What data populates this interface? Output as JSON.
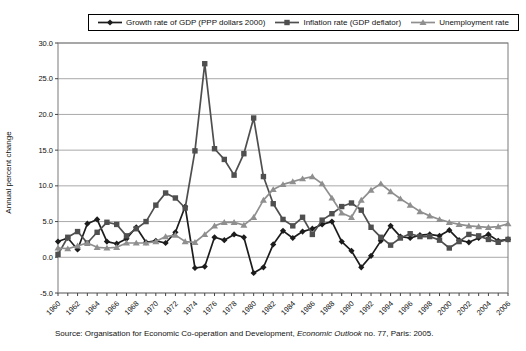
{
  "legend": {
    "items": [
      {
        "label": "Growth rate of GDP (PPP dollars 2000)",
        "marker": "diamond",
        "color": "#1c1c1c"
      },
      {
        "label": "Inflation rate (GDP deflator)",
        "marker": "square",
        "color": "#4f4f4f"
      },
      {
        "label": "Unemployment rate",
        "marker": "triangle",
        "color": "#8f8f8f"
      }
    ]
  },
  "axes": {
    "y_title": "Annual percent change",
    "y_ticks": [
      "30.0",
      "25.0",
      "20.0",
      "15.0",
      "10.0",
      "5.0",
      "0.0",
      "-5.0"
    ],
    "x_ticks": [
      "1960",
      "1962",
      "1964",
      "1966",
      "1968",
      "1970",
      "1972",
      "1974",
      "1976",
      "1978",
      "1980",
      "1982",
      "1984",
      "1986",
      "1988",
      "1990",
      "1992",
      "1994",
      "1996",
      "1998",
      "2000",
      "2002",
      "2004",
      "2006"
    ]
  },
  "source": {
    "prefix": "Source: Organisation for Economic Co-operation and Development, ",
    "italic": "Economic Outlook",
    "suffix": " no. 77, Paris: 2005."
  },
  "colors": {
    "gridline": "#a9a9a9",
    "plot_border": "#7a7a7a",
    "axis_text": "#111111",
    "legend_border": "#000000"
  },
  "chart_data": {
    "type": "line",
    "title": "",
    "xlabel": "",
    "ylabel": "Annual percent change",
    "ylim": [
      -5,
      30
    ],
    "ytick_step": 5,
    "grid": true,
    "legend_position": "top",
    "x": [
      1960,
      1961,
      1962,
      1963,
      1964,
      1965,
      1966,
      1967,
      1968,
      1969,
      1970,
      1971,
      1972,
      1973,
      1974,
      1975,
      1976,
      1977,
      1978,
      1979,
      1980,
      1981,
      1982,
      1983,
      1984,
      1985,
      1986,
      1987,
      1988,
      1989,
      1990,
      1991,
      1992,
      1993,
      1994,
      1995,
      1996,
      1997,
      1998,
      1999,
      2000,
      2001,
      2002,
      2003,
      2004,
      2005,
      2006
    ],
    "series": [
      {
        "name": "Growth rate of GDP (PPP dollars 2000)",
        "marker": "diamond",
        "color": "#1c1c1c",
        "values": [
          2.2,
          2.7,
          1.1,
          4.7,
          5.3,
          2.2,
          1.9,
          2.6,
          4.2,
          2.1,
          2.3,
          2.0,
          3.5,
          7.1,
          -1.5,
          -1.3,
          2.8,
          2.4,
          3.2,
          2.8,
          -2.2,
          -1.4,
          1.8,
          3.7,
          2.7,
          3.6,
          4.0,
          4.6,
          5.0,
          2.2,
          0.9,
          -1.4,
          0.2,
          2.3,
          4.4,
          2.9,
          2.7,
          3.1,
          3.2,
          3.0,
          3.8,
          2.4,
          2.1,
          2.7,
          3.2,
          2.3,
          2.5
        ]
      },
      {
        "name": "Inflation rate (GDP deflator)",
        "marker": "square",
        "color": "#4f4f4f",
        "values": [
          0.4,
          2.8,
          3.6,
          2.0,
          3.5,
          4.9,
          4.6,
          3.0,
          4.0,
          5.0,
          7.3,
          9.0,
          8.3,
          6.9,
          14.9,
          27.1,
          15.2,
          13.7,
          11.5,
          14.5,
          19.5,
          11.3,
          7.5,
          5.3,
          4.4,
          5.6,
          3.2,
          5.2,
          6.1,
          7.1,
          7.6,
          6.6,
          4.2,
          2.8,
          1.7,
          2.7,
          3.3,
          2.9,
          2.9,
          2.4,
          1.3,
          2.2,
          3.2,
          3.0,
          2.5,
          2.1,
          2.5
        ]
      },
      {
        "name": "Unemployment rate",
        "marker": "triangle",
        "color": "#8f8f8f",
        "values": [
          1.3,
          1.2,
          1.6,
          2.0,
          1.4,
          1.3,
          1.4,
          2.0,
          2.0,
          2.0,
          2.2,
          2.9,
          3.1,
          2.2,
          2.1,
          3.2,
          4.4,
          4.9,
          4.9,
          4.5,
          5.6,
          8.0,
          9.5,
          10.2,
          10.6,
          11.0,
          11.3,
          10.3,
          8.3,
          6.2,
          5.6,
          8.0,
          9.4,
          10.3,
          9.2,
          8.2,
          7.3,
          6.4,
          5.8,
          5.3,
          4.9,
          4.6,
          4.4,
          4.3,
          4.2,
          4.3,
          4.7
        ]
      }
    ],
    "source_note": "Source: Organisation for Economic Co-operation and Development, Economic Outlook no. 77, Paris: 2005."
  }
}
